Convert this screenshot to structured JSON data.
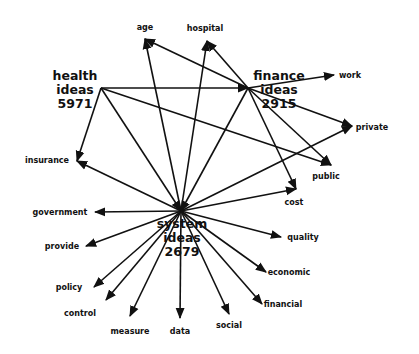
{
  "diagram": {
    "type": "concept-network",
    "hubs": [
      {
        "id": "health",
        "lines": [
          "health",
          "ideas",
          "5971"
        ],
        "x": 75,
        "y": 80,
        "ax": 101,
        "ay": 88
      },
      {
        "id": "finance",
        "lines": [
          "finance",
          "ideas",
          "2915"
        ],
        "x": 279,
        "y": 80,
        "ax": 248,
        "ay": 88
      },
      {
        "id": "system",
        "lines": [
          "system",
          "ideas",
          "2679"
        ],
        "x": 182,
        "y": 228,
        "ax": 181,
        "ay": 211
      }
    ],
    "leaves": [
      {
        "id": "age",
        "label": "age",
        "x": 145,
        "y": 30,
        "tx": 145,
        "ty": 39
      },
      {
        "id": "hospital",
        "label": "hospital",
        "x": 205,
        "y": 31,
        "tx": 207,
        "ty": 41
      },
      {
        "id": "work",
        "label": "work",
        "x": 350,
        "y": 78,
        "tx": 334,
        "ty": 75
      },
      {
        "id": "private",
        "label": "private",
        "x": 372,
        "y": 130,
        "tx": 352,
        "ty": 126
      },
      {
        "id": "insurance",
        "label": "insurance",
        "x": 47,
        "y": 163,
        "tx": 77,
        "ty": 161
      },
      {
        "id": "public",
        "label": "public",
        "x": 326,
        "y": 179,
        "tx": 331,
        "ty": 165
      },
      {
        "id": "cost",
        "label": "cost",
        "x": 294,
        "y": 205,
        "tx": 296,
        "ty": 189
      },
      {
        "id": "government",
        "label": "government",
        "x": 60,
        "y": 215,
        "tx": 95,
        "ty": 212
      },
      {
        "id": "provide",
        "label": "provide",
        "x": 62,
        "y": 249,
        "tx": 86,
        "ty": 246
      },
      {
        "id": "quality",
        "label": "quality",
        "x": 303,
        "y": 240,
        "tx": 281,
        "ty": 237
      },
      {
        "id": "policy",
        "label": "policy",
        "x": 69,
        "y": 290,
        "tx": 94,
        "ty": 287
      },
      {
        "id": "economic",
        "label": "economic",
        "x": 289,
        "y": 275,
        "tx": 266,
        "ty": 272
      },
      {
        "id": "control",
        "label": "control",
        "x": 80,
        "y": 316,
        "tx": 106,
        "ty": 300
      },
      {
        "id": "financial",
        "label": "financial",
        "x": 283,
        "y": 307,
        "tx": 262,
        "ty": 304
      },
      {
        "id": "measure",
        "label": "measure",
        "x": 130,
        "y": 334,
        "tx": 130,
        "ty": 316
      },
      {
        "id": "data",
        "label": "data",
        "x": 180,
        "y": 334,
        "tx": 180,
        "ty": 318
      },
      {
        "id": "social",
        "label": "social",
        "x": 229,
        "y": 328,
        "tx": 229,
        "ty": 314
      }
    ],
    "edges": [
      [
        "health",
        "finance"
      ],
      [
        "health",
        "public"
      ],
      [
        "health",
        "insurance"
      ],
      [
        "health",
        "system"
      ],
      [
        "finance",
        "age"
      ],
      [
        "finance",
        "hospital"
      ],
      [
        "finance",
        "public"
      ],
      [
        "finance",
        "cost"
      ],
      [
        "finance",
        "system"
      ],
      [
        "finance",
        "work"
      ],
      [
        "finance",
        "private"
      ],
      [
        "system",
        "age"
      ],
      [
        "system",
        "hospital"
      ],
      [
        "system",
        "private"
      ],
      [
        "system",
        "cost"
      ],
      [
        "system",
        "insurance"
      ],
      [
        "system",
        "government"
      ],
      [
        "system",
        "provide"
      ],
      [
        "system",
        "quality"
      ],
      [
        "system",
        "policy"
      ],
      [
        "system",
        "economic"
      ],
      [
        "system",
        "control"
      ],
      [
        "system",
        "financial"
      ],
      [
        "system",
        "measure"
      ],
      [
        "system",
        "data"
      ],
      [
        "system",
        "social"
      ]
    ]
  }
}
